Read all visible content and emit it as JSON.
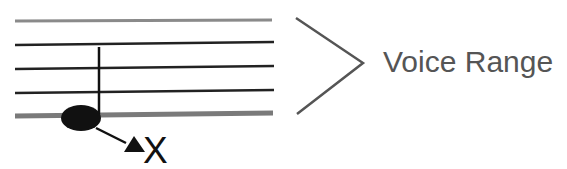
{
  "diagram": {
    "staff": {
      "lines": [
        {
          "y": 21,
          "style": "gray"
        },
        {
          "y": 44,
          "style": "solid"
        },
        {
          "y": 68,
          "style": "solid"
        },
        {
          "y": 92,
          "style": "solid"
        },
        {
          "y": 116,
          "style": "thick-gray"
        }
      ],
      "x_start": 15,
      "x_end": 273
    },
    "note": {
      "head": {
        "cx": 81,
        "cy": 118,
        "rx": 20,
        "ry": 13
      },
      "stem": {
        "x": 99,
        "y_top": 47,
        "y_bottom": 114
      }
    },
    "pointer": {
      "from": [
        96,
        128
      ],
      "to": [
        126,
        143
      ]
    },
    "marker_label": "X",
    "marker_icon": "triangle-up",
    "range_label": "Voice Range",
    "colors": {
      "line": "#222222",
      "gray_line": "#777777",
      "note": "#111111",
      "bracket": "#555555",
      "text": "#555555"
    }
  }
}
